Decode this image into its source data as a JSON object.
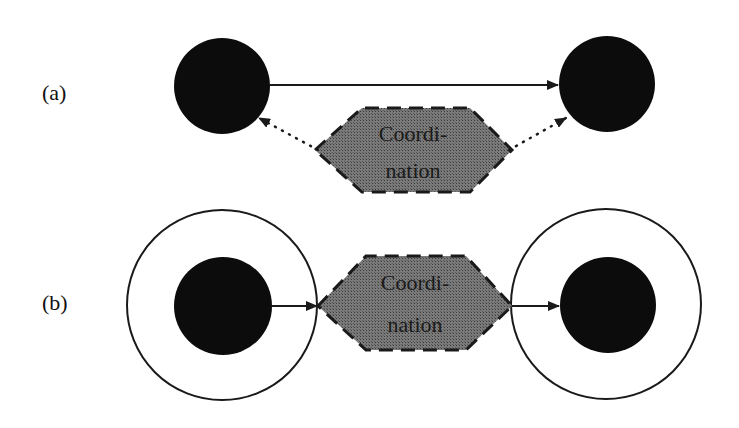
{
  "diagram": {
    "colors": {
      "node_fill": "#0c0c0c",
      "hexagon_fill": "#6e6e6e",
      "stroke": "#1a1a1a",
      "background": "#ffffff"
    },
    "panel_a": {
      "label": "(a)",
      "coordination_line1": "Coordi-",
      "coordination_line2": "nation"
    },
    "panel_b": {
      "label": "(b)",
      "coordination_line1": "Coordi-",
      "coordination_line2": "nation"
    }
  }
}
